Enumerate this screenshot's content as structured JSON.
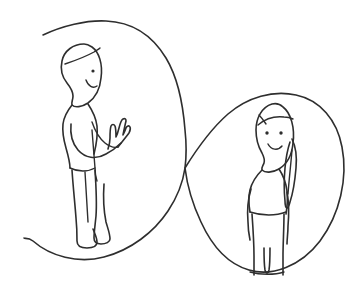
{
  "image": {
    "kind": "hand-drawn-line-illustration",
    "title": "Two people standing inside an infinity loop",
    "width": 361,
    "height": 286,
    "background_color": "#ffffff",
    "ink_color": "#2e2e2e",
    "stroke_width": 1.6,
    "has_text": false,
    "text_content": ""
  },
  "scene": {
    "description": "A sketch of an infinity / figure-eight shaped loop drawn as one open line. A person stands in the left loop gesturing with an open hand toward a second person standing in the right loop.",
    "elements": [
      {
        "name": "infinity-loop",
        "label": "Infinity loop",
        "shape": "figure-eight",
        "open_ended": true,
        "crossing_point": [
          185,
          168
        ],
        "left_lobe_center": [
          105,
          150
        ],
        "right_lobe_center": [
          270,
          182
        ],
        "start_point": [
          43,
          35
        ],
        "end_point": [
          24,
          238
        ]
      },
      {
        "name": "figure-left",
        "label": "Left person",
        "orientation": "profile facing right",
        "hair": "short hair with a fringe line across the forehead",
        "eyes": 1,
        "expression": "smiling",
        "pose": "one arm extended forward with an open palm-up hand",
        "bounds": [
          57,
          44,
          140,
          250
        ]
      },
      {
        "name": "figure-right",
        "label": "Right person",
        "orientation": "facing forward",
        "hair": "long hair falling over the right shoulder",
        "eyes": 2,
        "expression": "smiling",
        "pose": "standing, arms at the sides",
        "bounds": [
          240,
          100,
          310,
          276
        ]
      }
    ]
  }
}
